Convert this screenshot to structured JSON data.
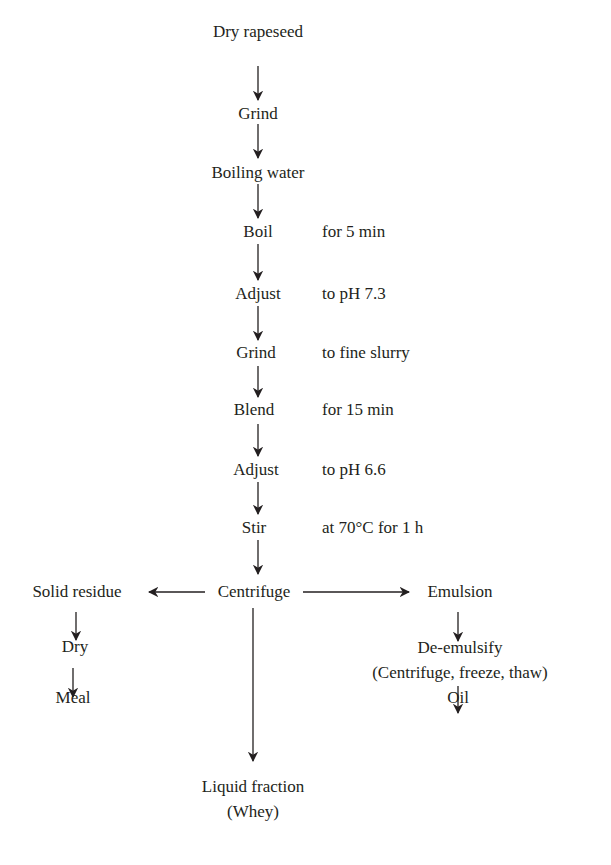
{
  "flowchart": {
    "steps": [
      {
        "label": "Dry rapeseed",
        "note": ""
      },
      {
        "label": "Grind",
        "note": ""
      },
      {
        "label": "Boiling water",
        "note": ""
      },
      {
        "label": "Boil",
        "note": "for 5 min"
      },
      {
        "label": "Adjust",
        "note": "to pH 7.3"
      },
      {
        "label": "Grind",
        "note": "to fine slurry"
      },
      {
        "label": "Blend",
        "note": "for 15 min"
      },
      {
        "label": "Adjust",
        "note": "to pH 6.6"
      },
      {
        "label": "Stir",
        "note": "at 70°C for 1 h"
      },
      {
        "label": "Centrifuge",
        "note": ""
      }
    ],
    "left_branch": [
      "Solid residue",
      "Dry",
      "Meal"
    ],
    "right_branch": [
      "Emulsion",
      "De-emulsify",
      "(Centrifuge, freeze, thaw)",
      "Oil"
    ],
    "bottom_branch": [
      "Liquid fraction",
      "(Whey)"
    ]
  }
}
